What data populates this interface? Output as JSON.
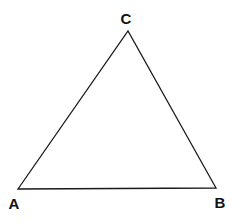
{
  "diagram": {
    "type": "triangle",
    "vertices": [
      {
        "label": "A",
        "x": 18,
        "y": 189,
        "label_x": 14,
        "label_y": 209
      },
      {
        "label": "B",
        "x": 216,
        "y": 188,
        "label_x": 220,
        "label_y": 208
      },
      {
        "label": "C",
        "x": 128,
        "y": 31,
        "label_x": 126,
        "label_y": 24
      }
    ],
    "stroke_color": "#1a1a1a",
    "background": "#ffffff"
  }
}
